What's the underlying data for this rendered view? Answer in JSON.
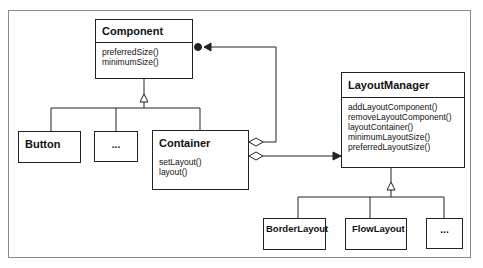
{
  "diagram": {
    "type": "UML class diagram",
    "classes": {
      "component": {
        "name": "Component",
        "operations": [
          "preferredSize()",
          "minimumSize()"
        ]
      },
      "button": {
        "name": "Button"
      },
      "component_more": {
        "name": "..."
      },
      "container": {
        "name": "Container",
        "operations": [
          "setLayout()",
          "layout()"
        ]
      },
      "layout_manager": {
        "name": "LayoutManager",
        "operations": [
          "addLayoutComponent()",
          "removeLayoutComponent()",
          "layoutContainer()",
          "minimumLayoutSize()",
          "preferredLayoutSize()"
        ]
      },
      "border_layout": {
        "name": "BorderLayout"
      },
      "flow_layout": {
        "name": "FlowLayout"
      },
      "layout_more": {
        "name": "..."
      }
    },
    "relationships": [
      {
        "from": "Button",
        "to": "Component",
        "kind": "generalization"
      },
      {
        "from": "...",
        "to": "Component",
        "kind": "generalization"
      },
      {
        "from": "Container",
        "to": "Component",
        "kind": "generalization"
      },
      {
        "from": "Container",
        "to": "Component",
        "kind": "aggregation (many)"
      },
      {
        "from": "Container",
        "to": "LayoutManager",
        "kind": "aggregation"
      },
      {
        "from": "BorderLayout",
        "to": "LayoutManager",
        "kind": "generalization"
      },
      {
        "from": "FlowLayout",
        "to": "LayoutManager",
        "kind": "generalization"
      },
      {
        "from": "...",
        "to": "LayoutManager",
        "kind": "generalization"
      }
    ],
    "colors": {
      "line": "#222222",
      "frame": "#8a8a8a",
      "background": "#ffffff"
    }
  }
}
